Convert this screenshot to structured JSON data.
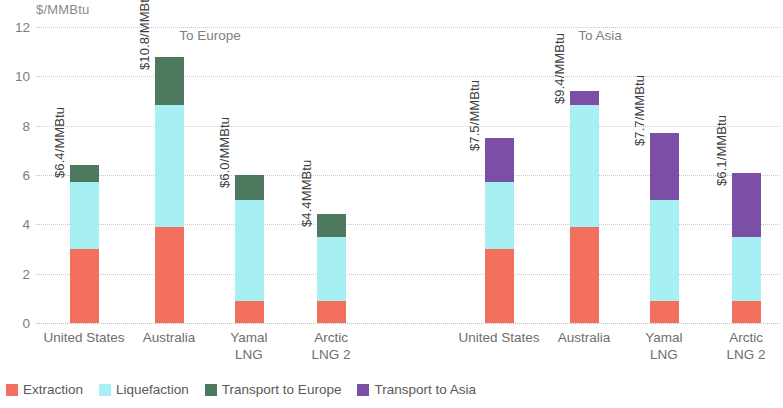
{
  "chart_data": {
    "type": "bar",
    "subtype": "stacked-bar-grouped",
    "title": "",
    "subtitle": "",
    "xlabel": "",
    "ylabel": "$/MMBtu",
    "ylim": [
      0,
      12
    ],
    "yticks": [
      0,
      2,
      4,
      6,
      8,
      10,
      12
    ],
    "ytick_labels": [
      "0",
      "2",
      "4",
      "6",
      "8",
      "10",
      "12"
    ],
    "grid": true,
    "legend_position": "bottom-left",
    "panel_titles": [
      "To Europe",
      "To Asia"
    ],
    "categories": [
      "United States",
      "Australia",
      "Yamal LNG",
      "Arctic LNG 2"
    ],
    "panels": [
      {
        "name": "To Europe",
        "series": [
          {
            "name": "Extraction",
            "color": "#F4705E",
            "values": [
              3.0,
              3.9,
              0.9,
              0.9
            ]
          },
          {
            "name": "Liquefaction",
            "color": "#A6EFF2",
            "values": [
              2.7,
              4.95,
              4.1,
              2.6
            ]
          },
          {
            "name": "Transport to Europe",
            "color": "#4D7A5E",
            "values": [
              0.7,
              1.95,
              1.0,
              0.9
            ]
          }
        ],
        "totals": [
          6.4,
          10.8,
          6.0,
          4.4
        ],
        "total_labels": [
          "$6.4/MMBtu",
          "$10.8/MMBtu",
          "$6.0/MMBtu",
          "$4.4MMBtu"
        ]
      },
      {
        "name": "To Asia",
        "series": [
          {
            "name": "Extraction",
            "color": "#F4705E",
            "values": [
              3.0,
              3.9,
              0.9,
              0.9
            ]
          },
          {
            "name": "Liquefaction",
            "color": "#A6EFF2",
            "values": [
              2.7,
              4.95,
              4.1,
              2.6
            ]
          },
          {
            "name": "Transport to Asia",
            "color": "#7B4FA6",
            "values": [
              1.8,
              0.55,
              2.7,
              2.6
            ]
          }
        ],
        "totals": [
          7.5,
          9.4,
          7.7,
          6.1
        ],
        "total_labels": [
          "$7.5/MMBtu",
          "$9.4/MMBtu",
          "$7.7/MMBtu",
          "$6.1/MMBtu"
        ]
      }
    ],
    "legend": [
      {
        "label": "Extraction",
        "color": "#F4705E"
      },
      {
        "label": "Liquefaction",
        "color": "#A6EFF2"
      },
      {
        "label": "Transport to Europe",
        "color": "#4D7A5E"
      },
      {
        "label": "Transport to Asia",
        "color": "#7B4FA6"
      }
    ]
  },
  "axis": {
    "unit_caption": "$/MMBtu",
    "ticks": [
      "12",
      "10",
      "8",
      "6",
      "4",
      "2",
      "0"
    ]
  },
  "panel_titles": {
    "europe": "To Europe",
    "asia": "To Asia"
  },
  "categories": {
    "europe": [
      "United States",
      "Australia",
      "Yamal\nLNG",
      "Arctic\nLNG 2"
    ],
    "asia": [
      "United States",
      "Australia",
      "Yamal\nLNG",
      "Arctic\nLNG 2"
    ]
  },
  "value_labels": {
    "europe": [
      "$6.4/MMBtu",
      "$10.8/MMBtu",
      "$6.0/MMBtu",
      "$4.4MMBtu"
    ],
    "asia": [
      "$7.5/MMBtu",
      "$9.4/MMBtu",
      "$7.7/MMBtu",
      "$6.1/MMBtu"
    ]
  },
  "legend": {
    "items": [
      {
        "label": "Extraction"
      },
      {
        "label": "Liquefaction"
      },
      {
        "label": "Transport to Europe"
      },
      {
        "label": "Transport to Asia"
      }
    ]
  },
  "colors": {
    "extraction": "#F4705E",
    "liquefaction": "#A6EFF2",
    "transport_europe": "#4D7A5E",
    "transport_asia": "#7B4FA6",
    "grid": "#c9c9c9",
    "text": "#6e6e6e"
  }
}
